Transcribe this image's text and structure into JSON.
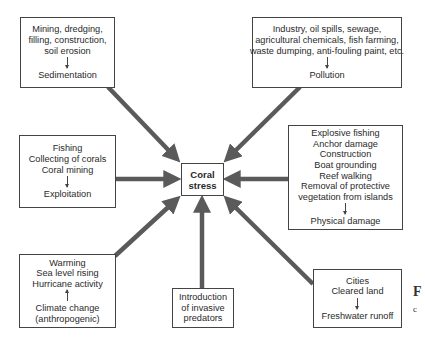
{
  "diagram": {
    "title": "Coral stress",
    "colors": {
      "arrow": "#5a5a5a",
      "border": "#444444",
      "text": "#2a2a2a",
      "background": "#ffffff"
    },
    "center": {
      "lines": [
        "Coral",
        "stress"
      ]
    },
    "boxes": [
      {
        "id": "sedimentation",
        "causes": [
          "Mining, dredging,",
          "filling, construction,",
          "soil erosion"
        ],
        "direction": "down",
        "result": [
          "Sedimentation"
        ]
      },
      {
        "id": "pollution",
        "causes": [
          "Industry, oil spills, sewage,",
          "agricultural chemicals, fish farming,",
          "waste dumping, anti-fouling paint, etc."
        ],
        "direction": "down",
        "result": [
          "Pollution"
        ]
      },
      {
        "id": "exploitation",
        "causes": [
          "Fishing",
          "Collecting of corals",
          "Coral mining"
        ],
        "direction": "down",
        "result": [
          "Exploitation"
        ]
      },
      {
        "id": "physical-damage",
        "causes": [
          "Explosive fishing",
          "Anchor damage",
          "Construction",
          "Boat grounding",
          "Reef walking",
          "Removal of protective",
          "vegetation from islands"
        ],
        "direction": "down",
        "result": [
          "Physical damage"
        ]
      },
      {
        "id": "climate-change",
        "causes": [
          "Warming",
          "Sea level rising",
          "Hurricane activity"
        ],
        "direction": "up",
        "result": [
          "Climate change",
          "(anthropogenic)"
        ]
      },
      {
        "id": "invasive-predators",
        "causes": [
          "Introduction",
          "of invasive",
          "predators"
        ],
        "direction": "none",
        "result": []
      },
      {
        "id": "freshwater-runoff",
        "causes": [
          "Cities",
          "Cleared land"
        ],
        "direction": "down",
        "result": [
          "Freshwater runoff"
        ]
      }
    ],
    "caption": {
      "label": "F",
      "text": "c"
    }
  }
}
